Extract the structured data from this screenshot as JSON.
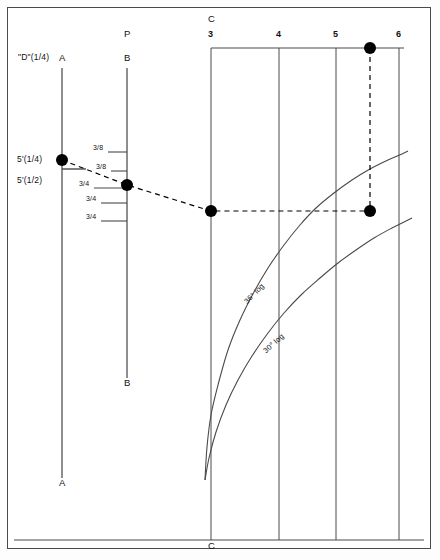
{
  "figure": {
    "type": "nomograph",
    "background": "#ffffff",
    "frame_color": "#4a4a4a",
    "line_color": "#4a4a4a",
    "marker_color": "#000000"
  },
  "axes": {
    "d_label": "\"D\"(1/4)",
    "p_label": "P",
    "c_label_top": "C",
    "c_label_bottom": "C",
    "scale_a": {
      "top_letter": "A",
      "bottom_letter": "A"
    },
    "scale_b": {
      "top_letter": "B",
      "bottom_letter": "B"
    }
  },
  "scale_a_points": [
    {
      "label": "5'(1/4)"
    },
    {
      "label": "5'(1/2)"
    }
  ],
  "scale_b_ticks": [
    {
      "label": "3/8"
    },
    {
      "label": "3/8"
    },
    {
      "label": "3/4"
    },
    {
      "label": "3/4"
    },
    {
      "label": "3/4"
    }
  ],
  "grid_numbers": [
    {
      "label": "3"
    },
    {
      "label": "4"
    },
    {
      "label": "5"
    },
    {
      "label": "6"
    }
  ],
  "curves": [
    {
      "label": "36° log"
    },
    {
      "label": "30° log"
    }
  ],
  "chart_data": {
    "type": "line",
    "title": "",
    "subtitle": "",
    "xlabel": "",
    "ylabel": "\"D\"(1/4)",
    "grid": true,
    "legend": "none",
    "xlim": [
      0,
      440
    ],
    "ylim": [
      560,
      0
    ],
    "vertical_scales": [
      {
        "name": "A",
        "x": 62,
        "y_top": 68,
        "y_bottom": 478,
        "top_letter": "A",
        "bottom_letter": "A"
      },
      {
        "name": "B",
        "x": 127,
        "y_top": 68,
        "y_bottom": 378,
        "top_letter": "B",
        "bottom_letter": "B"
      },
      {
        "name": "C",
        "x": 211,
        "y_top": 48,
        "y_bottom": 540,
        "top_letter": "C",
        "bottom_letter": "C"
      },
      {
        "name": "4",
        "x": 279,
        "y_top": 48,
        "y_bottom": 540,
        "top_letter": "4"
      },
      {
        "name": "5",
        "x": 336,
        "y_top": 48,
        "y_bottom": 540,
        "top_letter": "5"
      },
      {
        "name": "6",
        "x": 399,
        "y_top": 48,
        "y_bottom": 540,
        "top_letter": "6"
      }
    ],
    "top_rail": {
      "y": 48,
      "x_start": 211,
      "x_end": 404
    },
    "bottom_rail": {
      "y": 540,
      "x_start": 14,
      "x_end": 424
    },
    "scale_a_marks": [
      {
        "label": "5'(1/4)",
        "x": 62,
        "y": 160,
        "tick_x1": 62,
        "tick_x2": 86,
        "tick_y": 169
      },
      {
        "label": "5'(1/2)",
        "x": 62,
        "y": 181
      }
    ],
    "scale_b_marks": [
      {
        "label": "3/8",
        "y": 152,
        "tick_x1": 108,
        "tick_x2": 127
      },
      {
        "label": "3/8",
        "y": 171,
        "tick_x1": 111,
        "tick_x2": 127
      },
      {
        "label": "3/4",
        "y": 188,
        "tick_x1": 94,
        "tick_x2": 127
      },
      {
        "label": "3/4",
        "y": 203,
        "tick_x1": 101,
        "tick_x2": 127
      },
      {
        "label": "3/4",
        "y": 221,
        "tick_x1": 101,
        "tick_x2": 127
      }
    ],
    "series": [
      {
        "name": "36° log",
        "kind": "curve",
        "points": [
          [
            205,
            480
          ],
          [
            207,
            447
          ],
          [
            211,
            415
          ],
          [
            218,
            385
          ],
          [
            228,
            350
          ],
          [
            240,
            320
          ],
          [
            254,
            292
          ],
          [
            268,
            268
          ],
          [
            284,
            245
          ],
          [
            300,
            225
          ],
          [
            316,
            208
          ],
          [
            334,
            193
          ],
          [
            352,
            180
          ],
          [
            370,
            169
          ],
          [
            388,
            160
          ],
          [
            402,
            154
          ],
          [
            408,
            151
          ]
        ],
        "label_x": 243,
        "label_y": 300,
        "label_angle": -46
      },
      {
        "name": "30° log",
        "kind": "curve",
        "points": [
          [
            205,
            480
          ],
          [
            209,
            458
          ],
          [
            216,
            432
          ],
          [
            226,
            405
          ],
          [
            238,
            380
          ],
          [
            252,
            356
          ],
          [
            268,
            333
          ],
          [
            284,
            313
          ],
          [
            302,
            294
          ],
          [
            320,
            278
          ],
          [
            338,
            263
          ],
          [
            356,
            250
          ],
          [
            374,
            238
          ],
          [
            392,
            228
          ],
          [
            406,
            221
          ],
          [
            412,
            218
          ]
        ],
        "label_x": 262,
        "label_y": 349,
        "label_angle": -42
      }
    ],
    "construction_path": {
      "style": "dashed",
      "points": [
        [
          62,
          160
        ],
        [
          127,
          185
        ],
        [
          211,
          211
        ],
        [
          370,
          211
        ]
      ],
      "vertical_link": {
        "x": 370,
        "y_top": 48,
        "y_bottom": 211
      }
    },
    "markers": [
      {
        "x": 62,
        "y": 160,
        "on": "A",
        "value": "5'(1/4)"
      },
      {
        "x": 127,
        "y": 185,
        "on": "B",
        "value": "3/4"
      },
      {
        "x": 211,
        "y": 211,
        "on": "C",
        "value": "3"
      },
      {
        "x": 370,
        "y": 211,
        "on": "curve",
        "value": ""
      },
      {
        "x": 370,
        "y": 48,
        "on": "top-rail",
        "value": ""
      }
    ]
  }
}
